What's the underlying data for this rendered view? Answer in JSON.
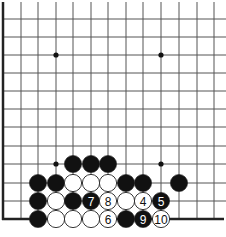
{
  "diagram": {
    "type": "go-board-partial",
    "colors": {
      "background": "#ffffff",
      "grid_line": "#555555",
      "edge_line": "#222222",
      "black_stone": "#111111",
      "white_stone": "#ffffff",
      "stone_outline": "#222222"
    },
    "grid": {
      "columns_x": [
        3,
        21,
        38,
        56,
        73,
        91,
        108,
        126,
        143,
        161,
        179,
        197,
        214
      ],
      "rows_y": [
        19,
        37,
        55,
        73,
        91,
        109,
        127,
        146,
        164,
        183,
        201,
        219
      ],
      "extend_right_to": 226,
      "extend_top_to": 2,
      "left_edge": true,
      "bottom_edge": true,
      "stone_radius": 8.6
    },
    "star_points": [
      {
        "col": 3,
        "row": 2
      },
      {
        "col": 9,
        "row": 2
      },
      {
        "col": 3,
        "row": 8
      },
      {
        "col": 9,
        "row": 8
      }
    ],
    "stones": [
      {
        "col": 4,
        "row": 8,
        "color": "black",
        "label": ""
      },
      {
        "col": 5,
        "row": 8,
        "color": "black",
        "label": ""
      },
      {
        "col": 6,
        "row": 8,
        "color": "black",
        "label": ""
      },
      {
        "col": 2,
        "row": 9,
        "color": "black",
        "label": ""
      },
      {
        "col": 3,
        "row": 9,
        "color": "black",
        "label": ""
      },
      {
        "col": 4,
        "row": 9,
        "color": "white",
        "label": ""
      },
      {
        "col": 5,
        "row": 9,
        "color": "white",
        "label": ""
      },
      {
        "col": 6,
        "row": 9,
        "color": "white",
        "label": ""
      },
      {
        "col": 7,
        "row": 9,
        "color": "black",
        "label": ""
      },
      {
        "col": 8,
        "row": 9,
        "color": "black",
        "label": ""
      },
      {
        "col": 10,
        "row": 9,
        "color": "black",
        "label": ""
      },
      {
        "col": 2,
        "row": 10,
        "color": "black",
        "label": ""
      },
      {
        "col": 3,
        "row": 10,
        "color": "white",
        "label": ""
      },
      {
        "col": 4,
        "row": 10,
        "color": "black",
        "label": ""
      },
      {
        "col": 5,
        "row": 10,
        "color": "black",
        "label": "7"
      },
      {
        "col": 6,
        "row": 10,
        "color": "white",
        "label": "8"
      },
      {
        "col": 7,
        "row": 10,
        "color": "white",
        "label": ""
      },
      {
        "col": 8,
        "row": 10,
        "color": "white",
        "label": "4"
      },
      {
        "col": 9,
        "row": 10,
        "color": "black",
        "label": "5"
      },
      {
        "col": 2,
        "row": 11,
        "color": "black",
        "label": ""
      },
      {
        "col": 3,
        "row": 11,
        "color": "white",
        "label": ""
      },
      {
        "col": 4,
        "row": 11,
        "color": "white",
        "label": ""
      },
      {
        "col": 5,
        "row": 11,
        "color": "white",
        "label": ""
      },
      {
        "col": 6,
        "row": 11,
        "color": "white",
        "label": "6"
      },
      {
        "col": 7,
        "row": 11,
        "color": "black",
        "label": ""
      },
      {
        "col": 8,
        "row": 11,
        "color": "black",
        "label": "9"
      },
      {
        "col": 9,
        "row": 11,
        "color": "white",
        "label": "10"
      }
    ],
    "move_labels": [
      "4",
      "5",
      "6",
      "7",
      "8",
      "9",
      "10"
    ]
  }
}
